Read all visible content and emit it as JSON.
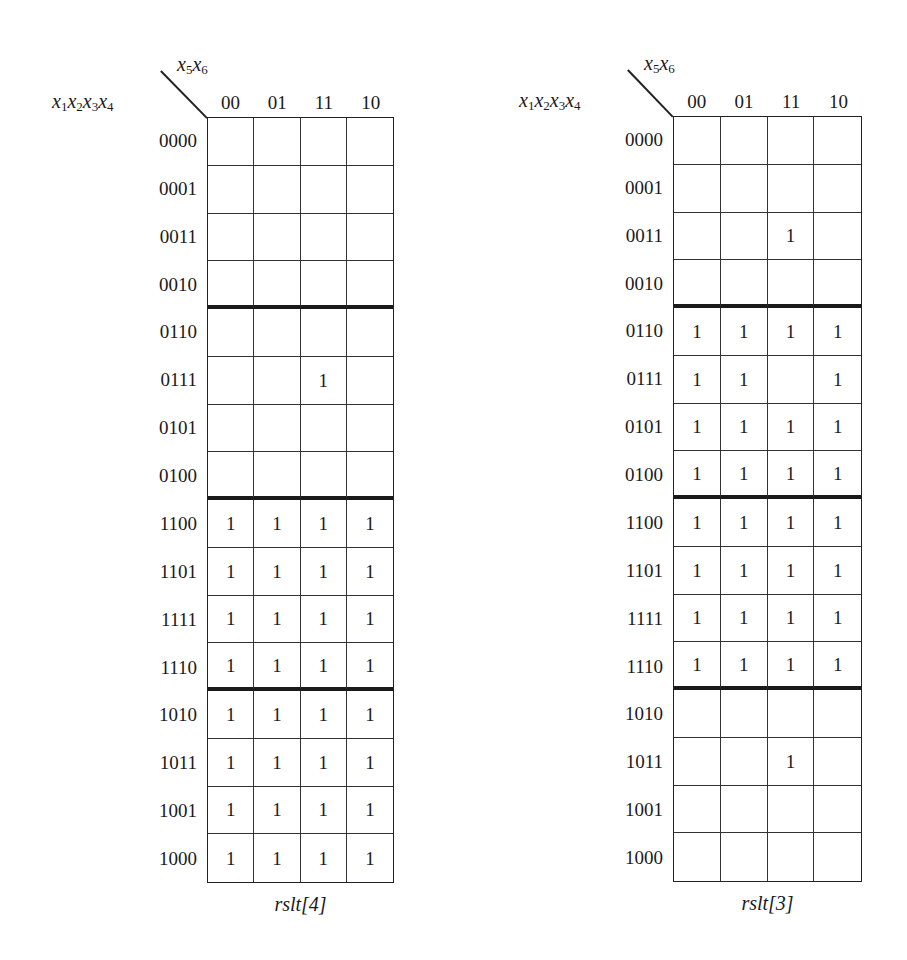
{
  "maps": [
    {
      "id": "rslt4",
      "caption": "rslt[4]",
      "row_var_label": {
        "base": "x",
        "subs": [
          "1",
          "2",
          "3",
          "4"
        ]
      },
      "col_var_label": {
        "base": "x",
        "subs": [
          "5",
          "6"
        ]
      },
      "col_headers": [
        "00",
        "01",
        "11",
        "10"
      ],
      "row_headers": [
        "0000",
        "0001",
        "0011",
        "0010",
        "0110",
        "0111",
        "0101",
        "0100",
        "1100",
        "1101",
        "1111",
        "1110",
        "1010",
        "1011",
        "1001",
        "1000"
      ],
      "thick_separators_after_rows": [
        3,
        7,
        11
      ],
      "cells": [
        [
          "",
          "",
          "",
          ""
        ],
        [
          "",
          "",
          "",
          ""
        ],
        [
          "",
          "",
          "",
          ""
        ],
        [
          "",
          "",
          "",
          ""
        ],
        [
          "",
          "",
          "",
          ""
        ],
        [
          "",
          "",
          "1",
          ""
        ],
        [
          "",
          "",
          "",
          ""
        ],
        [
          "",
          "",
          "",
          ""
        ],
        [
          "1",
          "1",
          "1",
          "1"
        ],
        [
          "1",
          "1",
          "1",
          "1"
        ],
        [
          "1",
          "1",
          "1",
          "1"
        ],
        [
          "1",
          "1",
          "1",
          "1"
        ],
        [
          "1",
          "1",
          "1",
          "1"
        ],
        [
          "1",
          "1",
          "1",
          "1"
        ],
        [
          "1",
          "1",
          "1",
          "1"
        ],
        [
          "1",
          "1",
          "1",
          "1"
        ]
      ]
    },
    {
      "id": "rslt3",
      "caption": "rslt[3]",
      "row_var_label": {
        "base": "x",
        "subs": [
          "1",
          "2",
          "3",
          "4"
        ]
      },
      "col_var_label": {
        "base": "x",
        "subs": [
          "5",
          "6"
        ]
      },
      "col_headers": [
        "00",
        "01",
        "11",
        "10"
      ],
      "row_headers": [
        "0000",
        "0001",
        "0011",
        "0010",
        "0110",
        "0111",
        "0101",
        "0100",
        "1100",
        "1101",
        "1111",
        "1110",
        "1010",
        "1011",
        "1001",
        "1000"
      ],
      "thick_separators_after_rows": [
        3,
        7,
        11
      ],
      "cells": [
        [
          "",
          "",
          "",
          ""
        ],
        [
          "",
          "",
          "",
          ""
        ],
        [
          "",
          "",
          "1",
          ""
        ],
        [
          "",
          "",
          "",
          ""
        ],
        [
          "1",
          "1",
          "1",
          "1"
        ],
        [
          "1",
          "1",
          "",
          "1"
        ],
        [
          "1",
          "1",
          "1",
          "1"
        ],
        [
          "1",
          "1",
          "1",
          "1"
        ],
        [
          "1",
          "1",
          "1",
          "1"
        ],
        [
          "1",
          "1",
          "1",
          "1"
        ],
        [
          "1",
          "1",
          "1",
          "1"
        ],
        [
          "1",
          "1",
          "1",
          "1"
        ],
        [
          "",
          "",
          "",
          ""
        ],
        [
          "",
          "",
          "1",
          ""
        ],
        [
          "",
          "",
          "",
          ""
        ],
        [
          "",
          "",
          "",
          ""
        ]
      ]
    }
  ]
}
